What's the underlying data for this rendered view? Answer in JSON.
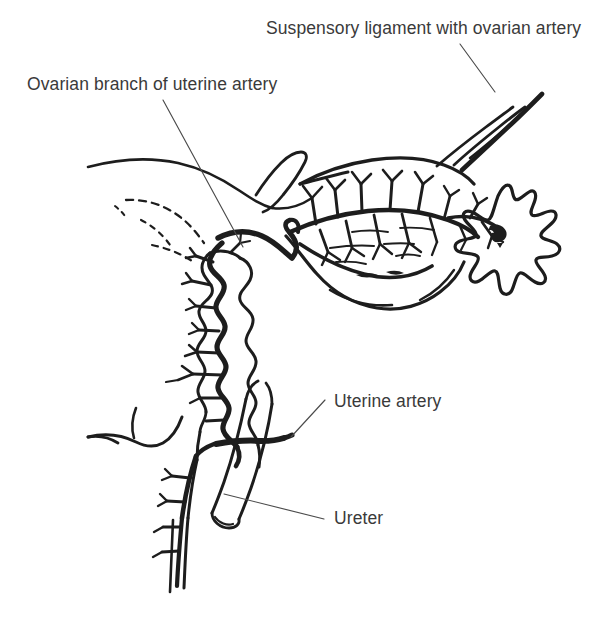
{
  "figure": {
    "type": "anatomical-line-drawing",
    "background_color": "#ffffff",
    "ink_color": "#1d1d1d",
    "text_color": "#3a3a3a",
    "leader_color": "#4b4b4b"
  },
  "labels": [
    {
      "id": "suspensory-ligament",
      "text": "Suspensory ligament with ovarian artery",
      "text_x": 266,
      "text_y": 34,
      "anchor": "start",
      "leader": "M 460 44 L 495 92"
    },
    {
      "id": "ovarian-branch",
      "text": "Ovarian branch of uterine artery",
      "text_x": 27,
      "text_y": 90,
      "anchor": "start",
      "leader": "M 163 100 L 243 247"
    },
    {
      "id": "uterine-artery",
      "text": "Uterine artery",
      "text_x": 334,
      "text_y": 407,
      "anchor": "start",
      "leader": "M 291 437 L 325 400"
    },
    {
      "id": "ureter",
      "text": "Ureter",
      "text_x": 334,
      "text_y": 524,
      "anchor": "start",
      "leader": "M 224 494 L 324 519"
    }
  ],
  "structures": [
    {
      "id": "broad-ligament-upper-border",
      "name": "Broad ligament upper border"
    },
    {
      "id": "round-ligament-stub",
      "name": "Round ligament stub"
    },
    {
      "id": "uterine-tube",
      "name": "Uterine tube"
    },
    {
      "id": "mesosalpinx-vascular-arcade",
      "name": "Mesosalpinx vascular arcade"
    },
    {
      "id": "ovary",
      "name": "Ovary"
    },
    {
      "id": "ovarian-hilum",
      "name": "Ovarian hilum"
    },
    {
      "id": "suspensory-ligament-band",
      "name": "Suspensory ligament of ovary"
    },
    {
      "id": "ovarian-artery-trunk",
      "name": "Ovarian artery"
    },
    {
      "id": "ovarian-branch-anastomosis",
      "name": "Ovarian branch of uterine artery"
    },
    {
      "id": "uterus-body",
      "name": "Uterus body"
    },
    {
      "id": "uterine-artery-tortuous",
      "name": "Tortuous uterine artery"
    },
    {
      "id": "arcuate-branches",
      "name": "Arcuate branches to uterine wall"
    },
    {
      "id": "cervix",
      "name": "Cervix"
    },
    {
      "id": "vagina",
      "name": "Vagina"
    },
    {
      "id": "vaginal-artery",
      "name": "Vaginal artery"
    },
    {
      "id": "ureter-tube",
      "name": "Ureter"
    },
    {
      "id": "uterine-artery-crossing",
      "name": "Uterine artery crossing ureter"
    },
    {
      "id": "hidden-edge-dashes",
      "name": "Hidden broad ligament edge"
    }
  ]
}
